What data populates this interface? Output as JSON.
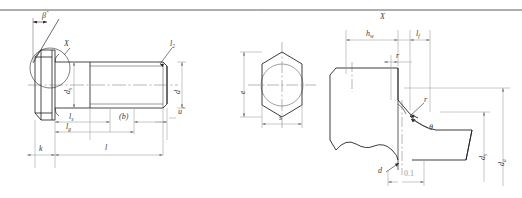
{
  "drawing": {
    "title": "Hexagon head bolt - dimensioned engineering drawing",
    "line_color": "#1a1a1a",
    "dim_color": "#9a9a9a",
    "text_color": "#3a3a3a"
  },
  "border": {
    "top_rule": true
  },
  "view_side": {
    "name": "side-elevation",
    "detail_circle_label": "X",
    "angle_label": "β",
    "angle_label_sup": "″",
    "labels": {
      "head_height": "k",
      "shank_dia": "d",
      "shank_dia_sub": "s",
      "thread_length_near": "l",
      "thread_length_near_sub": "s",
      "grip_length": "l",
      "grip_length_sub": "g",
      "thread_length": "(b)",
      "total_length": "l",
      "chamfer_end": "u",
      "chamfer_end_sup": "″",
      "dia_right": "d",
      "radius_leader": "l",
      "radius_leader_sub": "2"
    }
  },
  "view_end": {
    "name": "hexagon-end-view",
    "labels": {
      "across_corners": "e",
      "across_flats": "s"
    }
  },
  "view_detail": {
    "name": "detail-view-X",
    "detail_label": "X",
    "labels": {
      "washer_face_height": "h",
      "washer_face_height_sub": "w",
      "fillet_length": "l",
      "fillet_length_sub": "f",
      "radius": "r",
      "radius_leader": "r",
      "angle_leader": "θ",
      "shank_dia": "d",
      "shank_dia_sub": "s",
      "bearing_dia": "d",
      "bearing_dia_sub": "a",
      "nominal_dia": "d",
      "tolerance": "0.1"
    }
  }
}
